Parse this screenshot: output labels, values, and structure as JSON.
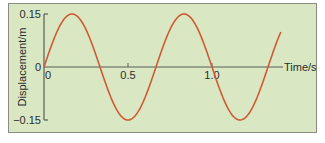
{
  "chart_data": {
    "type": "line",
    "title": "",
    "xlabel": "Time/s",
    "ylabel": "Displacement/m",
    "xlim": [
      0,
      1.41
    ],
    "ylim": [
      -0.15,
      0.15
    ],
    "x_ticks": [
      {
        "value": 0,
        "label": "0"
      },
      {
        "value": 0.5,
        "label": "0.5"
      },
      {
        "value": 1.0,
        "label": "1.0"
      }
    ],
    "y_ticks": [
      {
        "value": 0.15,
        "label": "0.15"
      },
      {
        "value": 0,
        "label": "0"
      },
      {
        "value": -0.15,
        "label": "−0.15"
      }
    ],
    "grid": false,
    "legend": null,
    "series": [
      {
        "name": "displacement",
        "color": "#cf5b34",
        "function": "0.15*sin(2*pi*1.5*t)",
        "amplitude": 0.15,
        "frequency_hz": 1.5,
        "period_s": 0.667,
        "x": [
          0,
          0.167,
          0.333,
          0.5,
          0.667,
          0.833,
          1.0,
          1.167,
          1.333,
          1.41
        ],
        "values": [
          0,
          0.15,
          0,
          -0.15,
          0,
          0.15,
          0,
          -0.15,
          0,
          0.08
        ]
      }
    ],
    "colors": {
      "background": "#d9e7c3",
      "frame": "#8a8d80",
      "axis": "#5a5f52",
      "curve": "#cf5b34"
    }
  }
}
